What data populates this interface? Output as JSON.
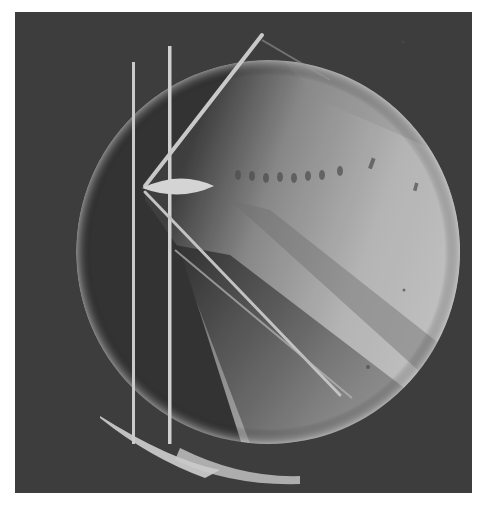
{
  "image": {
    "subject": "schlieren photograph of a supersonic airfoil in a circular viewing window",
    "colors": {
      "page_background": "#ffffff",
      "frame_background": "#3a3a3a",
      "window_dark": "#2e2e2e",
      "window_light": "#bdbdbd",
      "shock_line": "#d4d4d4",
      "airfoil": "#d8d8d8"
    }
  }
}
